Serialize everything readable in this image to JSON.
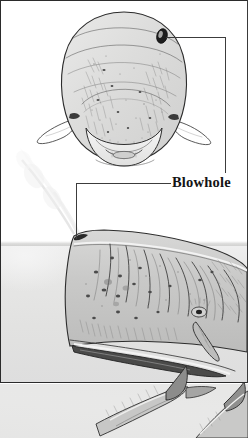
{
  "figure": {
    "kind": "scanned-book-illustration",
    "panel": {
      "border_color": "#2b2b2b",
      "background": "#ffffff"
    },
    "labels": [
      {
        "id": "blowhole",
        "text": "Blowhole",
        "style": "bold-serif",
        "color": "#141414"
      }
    ],
    "leader_lines": [
      {
        "id": "leader-to-head-front-view",
        "points_to": "blowhole on front view of head",
        "shape": "L-shaped",
        "color": "#3c3c3c"
      },
      {
        "id": "leader-to-head-side-view",
        "points_to": "blowhole on side view of head",
        "shape": "L-shaped",
        "color": "#3c3c3c"
      }
    ],
    "views": [
      {
        "id": "front-view-head",
        "caption_implied": "Front view of sperm whale head showing the single offset blowhole",
        "features": [
          "blowhole",
          "lower jaw",
          "teeth",
          "flippers",
          "skin wrinkles",
          "scars"
        ]
      },
      {
        "id": "side-view-body",
        "caption_implied": "Side view of sperm whale at the surface, blowing",
        "features": [
          "spout",
          "blowhole",
          "eye",
          "flipper",
          "lower jaw",
          "waterline",
          "skin wrinkles",
          "scars"
        ]
      },
      {
        "id": "lower-figures",
        "caption_implied": "Partial illustration of whale tail flukes below the panel",
        "features": [
          "flukes",
          "dorsal ridge"
        ]
      }
    ],
    "water": {
      "surface_color": "#e2e2e1",
      "spout_color": "#f2f2f2"
    }
  }
}
